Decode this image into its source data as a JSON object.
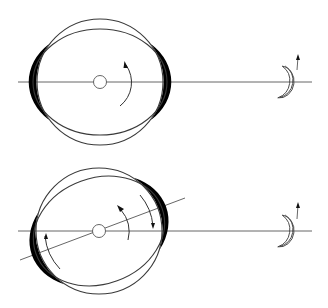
{
  "figures": [
    {
      "id": "top",
      "label": "aligned-tidal-bulge",
      "center": [
        100,
        82
      ],
      "axis_y": 82,
      "axis_x_range": [
        18,
        312
      ],
      "outer_circle_r": 63,
      "ellipse_rx": 67,
      "ellipse_ry": 53,
      "rotation_deg": 0,
      "core_r": 6,
      "moon_center": [
        289,
        82
      ]
    },
    {
      "id": "bottom",
      "label": "offset-tidal-bulge",
      "center": [
        99,
        231
      ],
      "axis_y": 231,
      "axis_x_range": [
        18,
        312
      ],
      "outer_circle_r": 63,
      "ellipse_rx": 67,
      "ellipse_ry": 53,
      "rotation_deg": -20,
      "core_r": 6,
      "moon_center": [
        289,
        231
      ]
    }
  ],
  "colors": {
    "background": "#ffffff",
    "line": "#555555",
    "bulge_fill": "#000000"
  }
}
